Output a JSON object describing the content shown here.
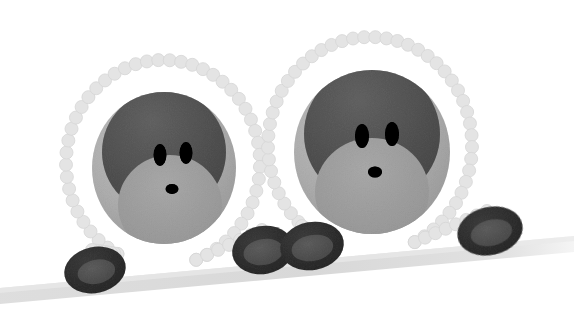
{
  "scene": {
    "title": "Two bead-ring characters on a sloped ground band",
    "width": 574,
    "height": 314,
    "background_color": "#ffffff",
    "style": "flat vector illustration, grayscale, soft halftone texture"
  },
  "palette": {
    "background": "#ffffff",
    "ground_band": "#d8d8d8",
    "ground_band_light": "#e6e6e6",
    "bead_chain": "#e2e2e2",
    "bead_chain_edge": "#d4d4d4",
    "head_outer": "#d0d0d0",
    "head_outer_light": "#dcdcdc",
    "head_mask_dark": "#8c8c8c",
    "head_mask_mid": "#9a9a9a",
    "muzzle_light": "#c9c9c9",
    "eye": "#1a1a1a",
    "nose": "#1a1a1a",
    "wheel_rim": "#6f6f6f",
    "wheel_rim_dark": "#5e5e5e",
    "wheel_hub": "#8a8a8a",
    "wheel_hub_light": "#979797"
  },
  "objects": {
    "ground": {
      "name": "sloped ground band",
      "from": {
        "x": 0,
        "y": 292
      },
      "to": {
        "x": 574,
        "y": 240
      },
      "thickness": 18,
      "color": "#d8d8d8"
    },
    "figures": [
      {
        "id": "figure-left",
        "label": "Left bead-ring character",
        "ring": {
          "center": {
            "x": 163,
            "y": 163
          },
          "radius_x": 97,
          "radius_y": 103,
          "bead_count": 46,
          "bead_radius": 6.5,
          "color": "#e2e2e2"
        },
        "head": {
          "center": {
            "x": 164,
            "y": 168
          },
          "radius_x": 72,
          "radius_y": 76,
          "color": "#d0d0d0"
        },
        "mask": {
          "label": "dark upper face band",
          "color": "#8c8c8c"
        },
        "eyes": [
          {
            "cx": 160,
            "cy": 155,
            "rx": 6.5,
            "ry": 11,
            "color": "#1a1a1a"
          },
          {
            "cx": 185,
            "cy": 154,
            "rx": 6.5,
            "ry": 11,
            "color": "#1a1a1a"
          }
        ],
        "nose": {
          "cx": 172,
          "cy": 190,
          "rx": 6.5,
          "ry": 5,
          "color": "#1a1a1a"
        }
      },
      {
        "id": "figure-right",
        "label": "Right bead-ring character",
        "ring": {
          "center": {
            "x": 370,
            "y": 145
          },
          "radius_x": 102,
          "radius_y": 108,
          "bead_count": 48,
          "bead_radius": 6.5,
          "color": "#e2e2e2"
        },
        "head": {
          "center": {
            "x": 372,
            "y": 152
          },
          "radius_x": 78,
          "radius_y": 82,
          "color": "#d0d0d0"
        },
        "mask": {
          "label": "dark upper face band",
          "color": "#8c8c8c"
        },
        "eyes": [
          {
            "cx": 362,
            "cy": 135,
            "rx": 7,
            "ry": 12,
            "color": "#1a1a1a"
          },
          {
            "cx": 391,
            "cy": 134,
            "rx": 7,
            "ry": 12,
            "color": "#1a1a1a"
          }
        ],
        "nose": {
          "cx": 375,
          "cy": 172,
          "rx": 7,
          "ry": 5.5,
          "color": "#1a1a1a"
        }
      }
    ],
    "wheels": [
      {
        "id": "wheel-left",
        "label": "bottom-left wheel",
        "cx": 95,
        "cy": 270,
        "rx": 30,
        "ry": 22,
        "rim_color": "#6f6f6f",
        "hub_color": "#8f8f8f",
        "rotation": -12
      },
      {
        "id": "wheel-center-a",
        "label": "center-left wheel",
        "cx": 263,
        "cy": 250,
        "rx": 30,
        "ry": 23,
        "rim_color": "#6f6f6f",
        "hub_color": "#8f8f8f",
        "rotation": -10
      },
      {
        "id": "wheel-center-b",
        "label": "center-right wheel",
        "cx": 311,
        "cy": 246,
        "rx": 31,
        "ry": 23,
        "rim_color": "#6f6f6f",
        "hub_color": "#8f8f8f",
        "rotation": -10
      },
      {
        "id": "wheel-right",
        "label": "bottom-right wheel",
        "cx": 490,
        "cy": 231,
        "rx": 32,
        "ry": 23,
        "rim_color": "#6f6f6f",
        "hub_color": "#8f8f8f",
        "rotation": -12
      }
    ]
  }
}
